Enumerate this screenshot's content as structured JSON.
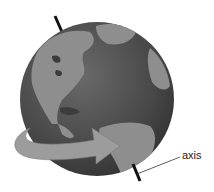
{
  "diagram": {
    "labels": {
      "axis": "axis"
    },
    "colors": {
      "ocean": "#4a4a4a",
      "land": "#8c8c8c",
      "arrow": "#9a9a9a",
      "axis_line": "#111111"
    }
  }
}
